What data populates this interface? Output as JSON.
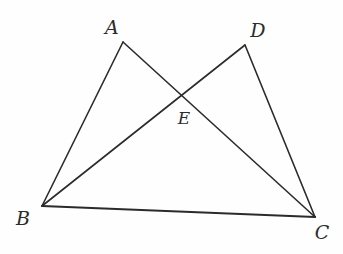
{
  "figure": {
    "background_color": "#fefefe",
    "stroke_color": "#2b2b2b",
    "canvas": {
      "width": 343,
      "height": 254
    }
  },
  "points": {
    "A": {
      "label": "A",
      "x": 123,
      "y": 42,
      "label_x": 112,
      "label_y": 27
    },
    "B": {
      "label": "B",
      "x": 42,
      "y": 206,
      "label_x": 23,
      "label_y": 218
    },
    "C": {
      "label": "C",
      "x": 315,
      "y": 217,
      "label_x": 322,
      "label_y": 232
    },
    "D": {
      "label": "D",
      "x": 245,
      "y": 45,
      "label_x": 258,
      "label_y": 30
    },
    "E": {
      "label": "E",
      "x": 181,
      "y": 95,
      "label_x": 184,
      "label_y": 118
    }
  },
  "segments": [
    {
      "name": "segment-AB",
      "from": "A",
      "to": "B",
      "x1": 123,
      "y1": 42,
      "x2": 42,
      "y2": 206,
      "width": 1.6
    },
    {
      "name": "segment-AC",
      "from": "A",
      "to": "C",
      "x1": 123,
      "y1": 42,
      "x2": 315,
      "y2": 217,
      "width": 1.6
    },
    {
      "name": "segment-BD",
      "from": "B",
      "to": "D",
      "x1": 42,
      "y1": 206,
      "x2": 245,
      "y2": 45,
      "width": 1.6
    },
    {
      "name": "segment-DC",
      "from": "D",
      "to": "C",
      "x1": 245,
      "y1": 45,
      "x2": 315,
      "y2": 217,
      "width": 1.6
    },
    {
      "name": "segment-BC",
      "from": "B",
      "to": "C",
      "x1": 42,
      "y1": 206,
      "x2": 315,
      "y2": 217,
      "width": 2.2
    }
  ]
}
